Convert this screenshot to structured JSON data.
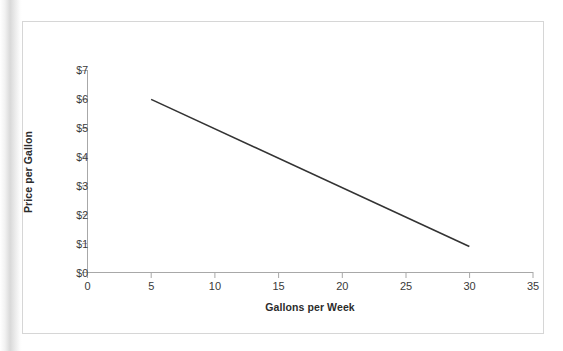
{
  "figure": {
    "top_artifact_text": "",
    "frame_color": "#d6d6d6",
    "background": "#ffffff"
  },
  "axes": {
    "y_title": "Price per Gallon",
    "x_title": "Gallons per Week",
    "axis_color": "#a8a8a8",
    "tick_text_color": "#3a3a3a",
    "title_text_color": "#2b2b2b"
  },
  "chart_data": {
    "type": "line",
    "title": "",
    "subtitle": "",
    "xlabel": "Gallons per Week",
    "ylabel": "Price per Gallon",
    "xlim": [
      0,
      35
    ],
    "ylim": [
      0,
      7
    ],
    "grid": false,
    "legend": null,
    "legend_position": "none",
    "xticks": [
      0,
      5,
      10,
      15,
      20,
      25,
      30,
      35
    ],
    "xtick_labels": [
      "0",
      "5",
      "10",
      "15",
      "20",
      "25",
      "30",
      "35"
    ],
    "yticks": [
      0,
      1,
      2,
      3,
      4,
      5,
      6,
      7
    ],
    "ytick_labels": [
      "$0",
      "$1",
      "$2",
      "$3",
      "$4",
      "$5",
      "$6",
      "$7"
    ],
    "series": [
      {
        "name": "Demand",
        "color": "#333333",
        "linewidth": 1.6,
        "x": [
          5,
          30
        ],
        "y": [
          6.0,
          0.9
        ]
      }
    ],
    "annotations": []
  }
}
